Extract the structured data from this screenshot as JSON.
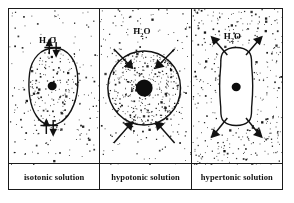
{
  "figure": {
    "panel_count": 3,
    "border_color": "#1a1a1a",
    "background_color": "#ffffff",
    "ink_color": "#111111"
  },
  "panels": [
    {
      "id": "isotonic",
      "label": "isotonic solution",
      "water_label": "H",
      "water_label_sub": "2",
      "water_label_end": "O",
      "cell_shape": "oval",
      "cell_state": "normal",
      "nucleus": "small round dark nucleus, centered",
      "stipple_inside": "medium",
      "stipple_outside": "medium",
      "arrows": "two pairs of small opposing arrows (in and out) at top and bottom of membrane",
      "arrow_direction": "bidirectional-equal",
      "arrow_count": 4
    },
    {
      "id": "hypotonic",
      "label": "hypotonic solution",
      "water_label": "H",
      "water_label_sub": "2",
      "water_label_end": "O",
      "cell_shape": "circle",
      "cell_state": "swollen",
      "nucleus": "large round dark nucleus, centered",
      "stipple_inside": "dense",
      "stipple_outside": "medium",
      "arrows": "four large arrows pointing inward toward the cell",
      "arrow_direction": "inward",
      "arrow_count": 4
    },
    {
      "id": "hypertonic",
      "label": "hypertonic solution",
      "water_label": "H",
      "water_label_sub": "2",
      "water_label_end": "O",
      "cell_shape": "crenated-rounded-rectangle",
      "cell_state": "shrunken",
      "nucleus": "small round dark nucleus, centered",
      "stipple_inside": "sparse",
      "stipple_outside": "dense",
      "arrows": "four large arrows pointing outward away from the cell",
      "arrow_direction": "outward",
      "arrow_count": 4
    }
  ]
}
